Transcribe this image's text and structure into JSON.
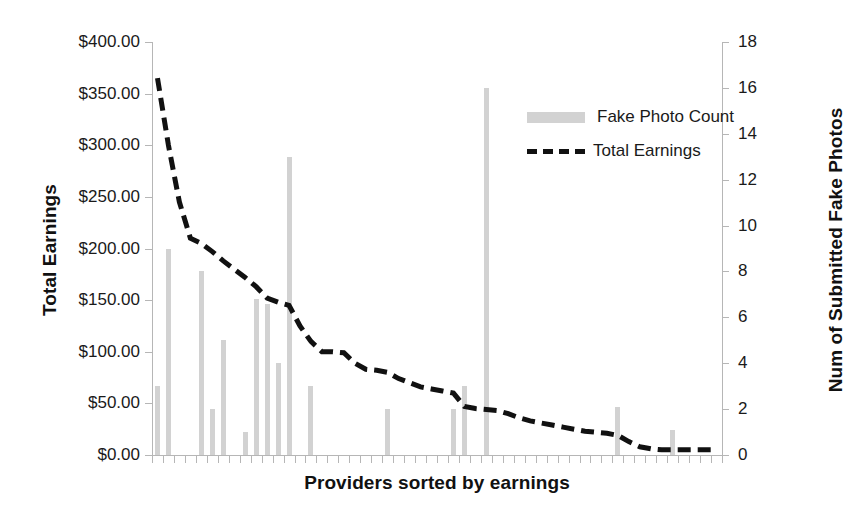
{
  "chart_data": {
    "type": "bar",
    "title": "",
    "xlabel": "Providers sorted by earnings",
    "ylabel": "Total Earnings",
    "y2label": "Num of Submitted Fake Photos",
    "grid": false,
    "legend_position": "inside-right",
    "ylim": [
      0,
      400
    ],
    "y2lim": [
      0,
      18
    ],
    "y_ticks": [
      "$0.00",
      "$50.00",
      "$100.00",
      "$150.00",
      "$200.00",
      "$250.00",
      "$300.00",
      "$350.00",
      "$400.00"
    ],
    "y_tick_values": [
      0,
      50,
      100,
      150,
      200,
      250,
      300,
      350,
      400
    ],
    "y2_ticks": [
      "0",
      "2",
      "4",
      "6",
      "8",
      "10",
      "12",
      "14",
      "16",
      "18"
    ],
    "y2_tick_values": [
      0,
      2,
      4,
      6,
      8,
      10,
      12,
      14,
      16,
      18
    ],
    "x_tick_labels": [],
    "categories": [
      1,
      2,
      3,
      4,
      5,
      6,
      7,
      8,
      9,
      10,
      11,
      12,
      13,
      14,
      15,
      16,
      17,
      18,
      19,
      20,
      21,
      22,
      23,
      24,
      25,
      26,
      27,
      28,
      29,
      30,
      31,
      32,
      33,
      34,
      35,
      36,
      37,
      38,
      39,
      40,
      41,
      42,
      43,
      44,
      45,
      46,
      47,
      48,
      49,
      50,
      51,
      52
    ],
    "series": [
      {
        "name": "Fake Photo Count",
        "type": "bar",
        "axis": "right",
        "color": "#d2d2d2",
        "values": [
          3,
          9,
          0,
          0,
          8,
          2,
          5,
          0,
          1,
          6.8,
          6.6,
          4,
          13,
          0,
          3,
          0,
          0,
          0,
          0,
          0,
          0,
          2,
          0,
          0,
          0,
          0,
          0,
          2,
          3,
          0,
          16,
          0,
          0,
          0,
          0,
          0,
          0,
          0,
          0,
          0,
          0,
          0,
          2.1,
          0,
          0,
          0,
          0,
          1.1,
          0,
          0,
          0,
          0
        ]
      },
      {
        "name": "Total Earnings",
        "type": "line",
        "axis": "left",
        "color": "#111111",
        "dash": true,
        "values": [
          365,
          300,
          245,
          210,
          205,
          197,
          188,
          180,
          172,
          163,
          152,
          148,
          145,
          125,
          110,
          100,
          100,
          99,
          89,
          83,
          82,
          80,
          74,
          70,
          66,
          64,
          62,
          60,
          47,
          45,
          44,
          43,
          40,
          36,
          33,
          31,
          29,
          27,
          25,
          23,
          22,
          21,
          19,
          13,
          8,
          6,
          5,
          5,
          5,
          5,
          5,
          5
        ]
      }
    ]
  },
  "legend": {
    "items": [
      {
        "label": "Fake Photo Count",
        "marker": "bar-swatch"
      },
      {
        "label": "Total Earnings",
        "marker": "dashed-line"
      }
    ]
  },
  "axes": {
    "left_title": "Total Earnings",
    "right_title": "Num of Submitted Fake Photos",
    "x_title": "Providers sorted by earnings"
  }
}
